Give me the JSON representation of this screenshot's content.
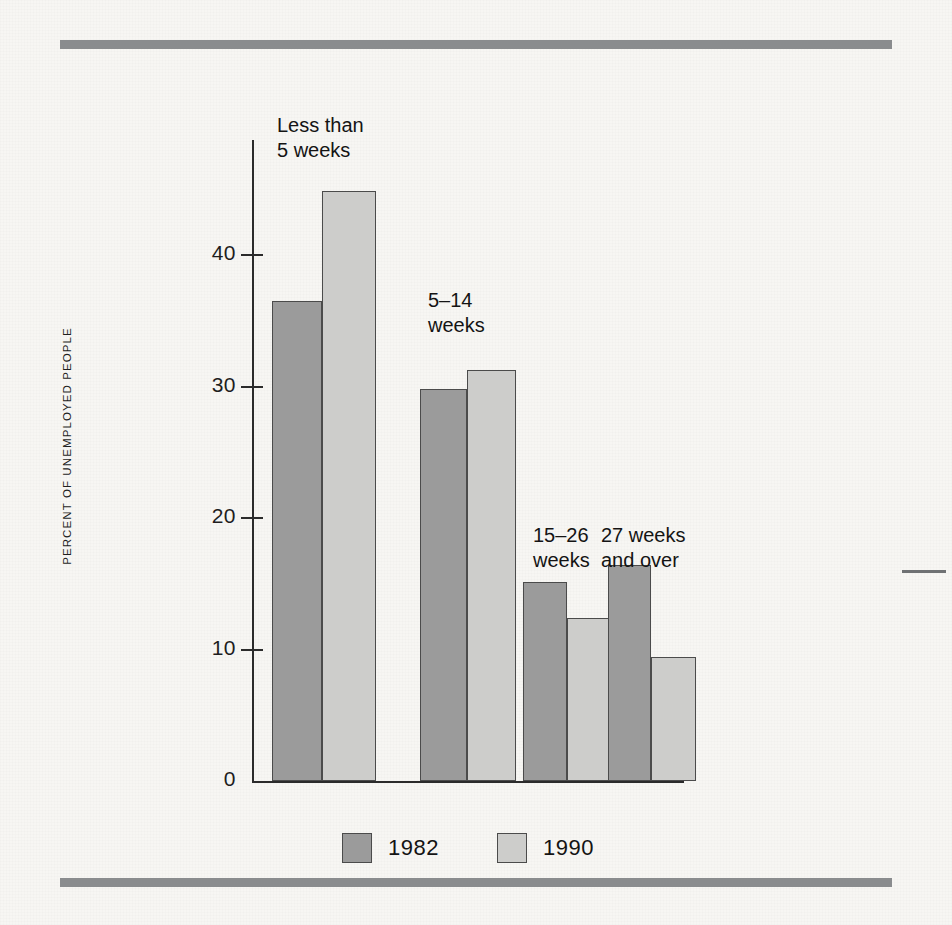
{
  "chart_data": {
    "type": "bar",
    "title": "",
    "subtitle": "",
    "xlabel": "",
    "ylabel": "PERCENT OF UNEMPLOYED PEOPLE",
    "ylim": [
      0,
      48
    ],
    "yticks": [
      "0",
      "10",
      "20",
      "30",
      "40"
    ],
    "ytick_values": [
      0,
      10,
      20,
      30,
      40
    ],
    "grid": false,
    "legend_position": "bottom-center",
    "categories": [
      "Less than\n5 weeks",
      "5–14\nweeks",
      "15–26\nweeks",
      "27 weeks\nand over"
    ],
    "series": [
      {
        "name": "1982",
        "color": "#9b9b9b",
        "values": [
          36.5,
          29.8,
          15.1,
          16.4
        ]
      },
      {
        "name": "1990",
        "color": "#cdcdcb",
        "values": [
          44.9,
          31.3,
          12.4,
          9.4
        ]
      }
    ]
  },
  "legend": {
    "items": [
      {
        "label": "1982",
        "color": "#9b9b9b"
      },
      {
        "label": "1990",
        "color": "#cdcdcb"
      }
    ]
  },
  "colors": {
    "background": "#f7f6f3",
    "rule": "#8a8c8e",
    "axis": "#2b2b2b",
    "bar_border": "#4b4b4b",
    "series_1982": "#9b9b9b",
    "series_1990": "#cdcdcb",
    "text": "#141414"
  }
}
